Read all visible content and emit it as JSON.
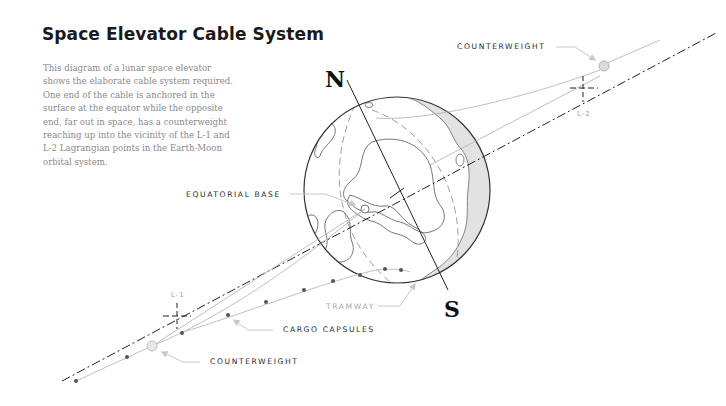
{
  "header": {
    "title": "Space Elevator Cable System",
    "description": "This diagram of a lunar space elevator shows the elaborate cable system required. One end of the cable is anchored in the surface at the equator while the opposite end, far out in space, has a counterweight reaching up into the vicinity of the L-1 and L-2 Lagrangian points in the Earth-Moon orbital system."
  },
  "labels": {
    "counterweight_top": "COUNTERWEIGHT",
    "counterweight_bottom": "COUNTERWEIGHT",
    "equatorial_base": "EQUATORIAL BASE",
    "tramway": "TRAMWAY",
    "cargo_capsules": "CARGO CAPSULES",
    "l1": "L-1",
    "l2": "L-2",
    "north": "N",
    "south": "S"
  },
  "colors": {
    "text": "#1a1a1a",
    "muted": "#8a8a8a",
    "line": "#b5b5b5",
    "dark_line": "#222222",
    "shade": "#e2e2e2"
  }
}
